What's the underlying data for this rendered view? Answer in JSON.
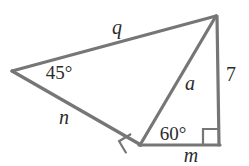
{
  "figure": {
    "stroke_color": "#767676",
    "stroke_width": 3,
    "text_color": "#2b2b2b",
    "background": "#ffffff",
    "width": 249,
    "height": 166,
    "vertices": {
      "left": {
        "name": "left-vertex",
        "x": 12,
        "y": 71
      },
      "top_right": {
        "name": "top-right-vertex",
        "x": 216,
        "y": 16
      },
      "bottom_mid": {
        "name": "bottom-middle-vertex",
        "x": 140,
        "y": 145
      },
      "bottom_right": {
        "name": "bottom-right-vertex",
        "x": 219,
        "y": 145
      }
    },
    "edges": [
      {
        "name": "edge-q",
        "from": "left",
        "to": "top_right",
        "label": "q"
      },
      {
        "name": "edge-n",
        "from": "left",
        "to": "bottom_mid",
        "label": "n"
      },
      {
        "name": "edge-a",
        "from": "bottom_mid",
        "to": "top_right",
        "label": "a"
      },
      {
        "name": "edge-7",
        "from": "top_right",
        "to": "bottom_right",
        "label": "7"
      },
      {
        "name": "edge-m",
        "from": "bottom_mid",
        "to": "bottom_right",
        "label": "m"
      }
    ],
    "side_labels": [
      {
        "name": "side-label-q",
        "text": "q",
        "x": 117,
        "y": 27,
        "style": "var"
      },
      {
        "name": "side-label-n",
        "text": "n",
        "x": 64,
        "y": 117,
        "style": "var"
      },
      {
        "name": "side-label-a",
        "text": "a",
        "x": 190,
        "y": 83,
        "style": "var"
      },
      {
        "name": "side-label-7",
        "text": "7",
        "x": 231,
        "y": 74,
        "style": "num"
      },
      {
        "name": "side-label-m",
        "text": "m",
        "x": 191,
        "y": 155,
        "style": "var"
      }
    ],
    "angle_labels": [
      {
        "name": "angle-label-45",
        "text": "45°",
        "x": 59,
        "y": 72,
        "style": "ang"
      },
      {
        "name": "angle-label-60",
        "text": "60°",
        "x": 173,
        "y": 133,
        "style": "ang"
      }
    ],
    "right_angle_marks": [
      {
        "name": "right-angle-mark-bottom-middle",
        "vertex": "bottom_mid",
        "size": 13,
        "rotation_deg": -32
      },
      {
        "name": "right-angle-mark-bottom-right",
        "vertex": "bottom_right",
        "size": 15,
        "rotation_deg": 0
      }
    ]
  }
}
